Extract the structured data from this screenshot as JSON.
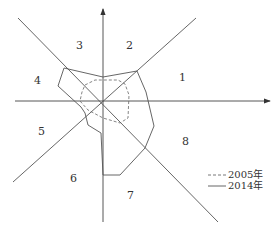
{
  "diagram": {
    "type": "octant-radar",
    "octant_labels": [
      "1",
      "2",
      "3",
      "4",
      "5",
      "6",
      "7",
      "8"
    ],
    "legend": [
      {
        "label": "2005年",
        "style": "dashed"
      },
      {
        "label": "2014年",
        "style": "solid"
      }
    ],
    "colors": {
      "line": "#555555",
      "axis": "#444444",
      "text": "#333333"
    }
  }
}
